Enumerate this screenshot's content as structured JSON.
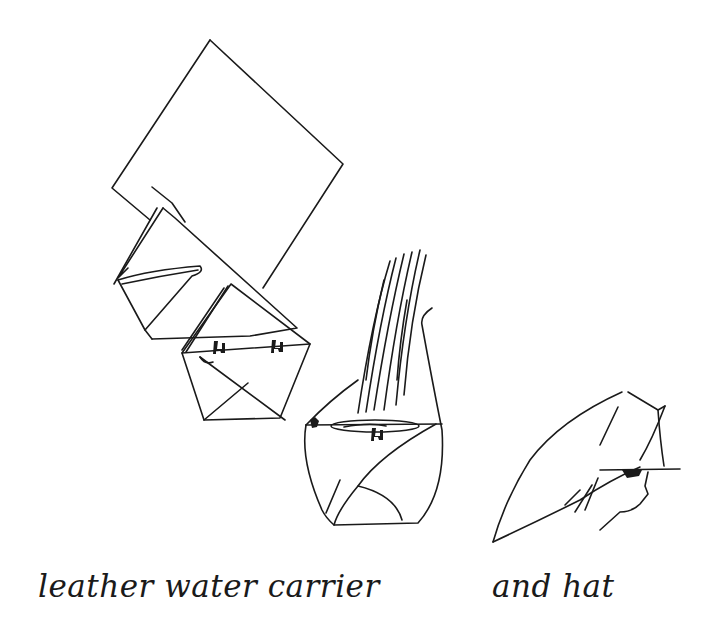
{
  "illustration": {
    "style": "hand-drawn ink line sketch",
    "background_color": "#ffffff",
    "ink_color": "#1a1a1a",
    "figures": [
      {
        "id": "flat-leather-square",
        "description": "square sheet of leather rotated as a diamond"
      },
      {
        "id": "first-fold",
        "description": "square folded into a triangle with a corner turned in"
      },
      {
        "id": "second-fold",
        "description": "folded pouch with tied stitches across the rim"
      },
      {
        "id": "filled-carrier",
        "description": "finished carrier holding water with streams pouring in"
      },
      {
        "id": "hat",
        "description": "the same leather folded and worn as a hat, side profile of a head"
      }
    ]
  },
  "captions": {
    "left": "leather water carrier",
    "right": "and hat"
  }
}
